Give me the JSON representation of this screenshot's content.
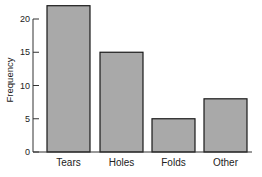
{
  "chart_data": {
    "type": "bar",
    "title": "",
    "xlabel": "",
    "ylabel": "Frequency",
    "categories": [
      "Tears",
      "Holes",
      "Folds",
      "Other"
    ],
    "values": [
      22,
      15,
      5,
      8
    ],
    "ylim": [
      0,
      22
    ],
    "yticks": [
      0,
      5,
      10,
      15,
      20
    ],
    "ytick_labels": [
      "0",
      "5",
      "10",
      "15",
      "20"
    ],
    "grid": false,
    "legend": "none",
    "bar_color": "#a9a9a9",
    "edge_color": "#1a1a1a"
  }
}
